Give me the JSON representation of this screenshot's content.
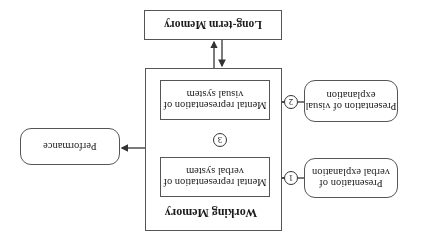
{
  "diagram": {
    "orientation": "rotated 180 degrees",
    "long_term_memory": {
      "label": "Long-term Memory"
    },
    "working_memory": {
      "label": "Working Memory",
      "verbal_representation": {
        "label": "Mental representation of verbal system"
      },
      "visual_representation": {
        "label": "Mental representation of visual system"
      }
    },
    "inputs": {
      "verbal": {
        "label": "Presentation of verbal explanation",
        "step": "1"
      },
      "visual": {
        "label": "Presentation of visual explanation",
        "step": "2"
      }
    },
    "link_step": "3",
    "performance": {
      "label": "Performance"
    },
    "colors": {
      "line": "#333333",
      "border": "#555555",
      "background": "#ffffff"
    }
  }
}
